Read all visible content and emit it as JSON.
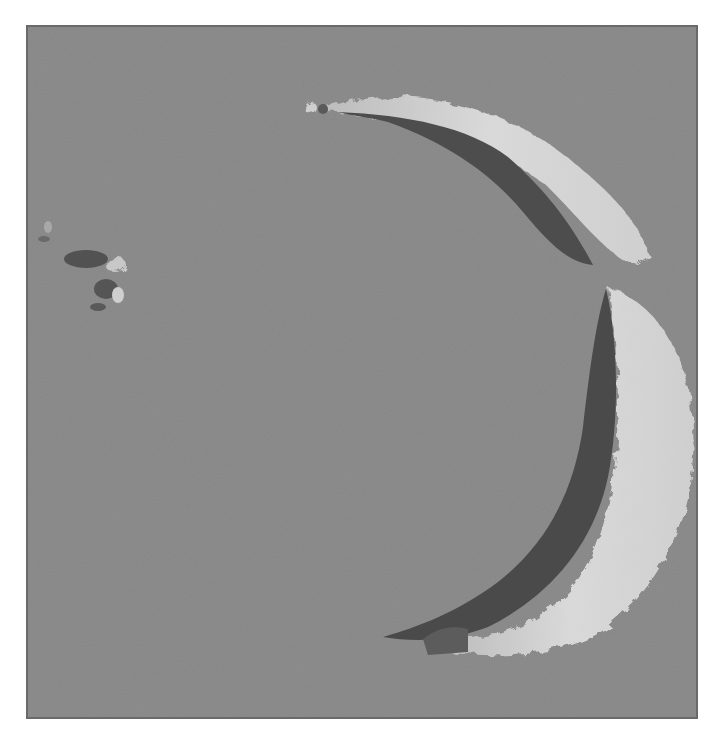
{
  "image": {
    "description": "Grayscale shaded-relief rendering of a crescent-shaped crater rim with two arc segments and a small debris cluster",
    "colors": {
      "background": "#8d8d8d",
      "border": "#6a6a6a",
      "highlight": "#d6d6d6",
      "shadow": "#4a4a4a",
      "page": "#ffffff"
    },
    "features": [
      {
        "name": "upper-arc",
        "type": "rim-segment"
      },
      {
        "name": "lower-arc",
        "type": "rim-segment"
      },
      {
        "name": "debris-cluster",
        "type": "scattered-fragments"
      }
    ]
  }
}
